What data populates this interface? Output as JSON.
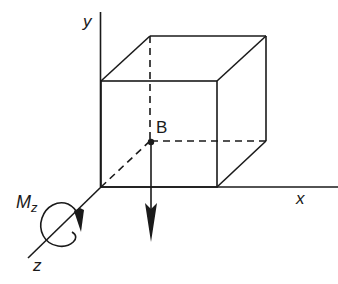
{
  "diagram": {
    "axes": {
      "x_label": "x",
      "y_label": "y",
      "z_label": "z"
    },
    "point_label": "B",
    "moment": {
      "symbol": "M",
      "subscript": "z"
    },
    "colors": {
      "stroke": "#1a1a1a",
      "background": "#ffffff"
    }
  }
}
